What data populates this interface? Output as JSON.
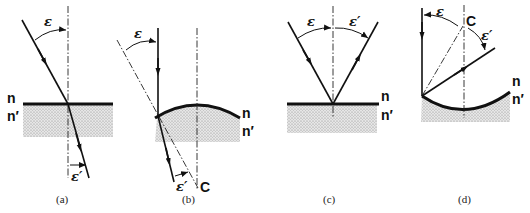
{
  "figure": {
    "panels": [
      {
        "id": "a",
        "caption": "(a)",
        "description": "Refraction at a plane surface",
        "medium_top": "n",
        "medium_bottom": "n′",
        "angle_incident": "ε",
        "angle_refracted": "ε′"
      },
      {
        "id": "b",
        "caption": "(b)",
        "description": "Refraction at a convex spherical surface with center of curvature C",
        "medium_top": "n",
        "medium_bottom": "n′",
        "angle_incident": "ε",
        "angle_refracted": "ε′",
        "center_label": "C"
      },
      {
        "id": "c",
        "caption": "(c)",
        "description": "Reflection at a plane surface",
        "medium_top": "n",
        "medium_bottom": "n′",
        "angle_incident": "ε",
        "angle_reflected": "ε′"
      },
      {
        "id": "d",
        "caption": "(d)",
        "description": "Reflection at a concave spherical surface with center of curvature C",
        "medium_top": "n",
        "medium_bottom": "n′",
        "angle_incident": "ε",
        "angle_reflected": "ε′",
        "center_label": "C"
      }
    ]
  }
}
